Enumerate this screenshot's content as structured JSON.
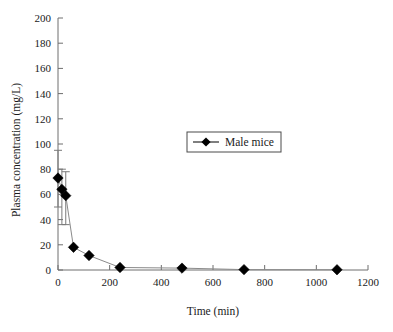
{
  "chart_data": {
    "type": "scatter",
    "title": "",
    "subtitle": "",
    "xlabel": "Time (min)",
    "ylabel": "Plasma concentration (mg/L)",
    "xlim": [
      0,
      1200
    ],
    "ylim": [
      0,
      200
    ],
    "xticks": [
      0,
      200,
      400,
      600,
      800,
      1000,
      1200
    ],
    "yticks": [
      0,
      20,
      40,
      60,
      80,
      100,
      120,
      140,
      160,
      180,
      200
    ],
    "xtick_labels": [
      "0",
      "200",
      "400",
      "600",
      "800",
      "1000",
      "1200"
    ],
    "ytick_labels": [
      "0",
      "20",
      "40",
      "60",
      "80",
      "100",
      "120",
      "140",
      "160",
      "180",
      "200"
    ],
    "grid": false,
    "legend_position": "upper center",
    "marker": "diamond",
    "marker_color": "#000000",
    "line_color": "#8a8a8a",
    "series": [
      {
        "name": "Male mice",
        "x": [
          0,
          15,
          30,
          60,
          120,
          240,
          480,
          720,
          1080
        ],
        "values": [
          73,
          64,
          59,
          18,
          11.5,
          2,
          1.5,
          0.3,
          0.2
        ],
        "error_upper": [
          95,
          80,
          78,
          null,
          null,
          null,
          null,
          null,
          null
        ],
        "error_lower": [
          50,
          36,
          36,
          null,
          null,
          null,
          null,
          null,
          null
        ]
      }
    ]
  },
  "legend": {
    "entries": [
      {
        "label": "Male mice",
        "marker": "diamond",
        "color": "#000000"
      }
    ]
  },
  "axes": {
    "x_title": "Time (min)",
    "y_title": "Plasma concentration (mg/L)"
  }
}
